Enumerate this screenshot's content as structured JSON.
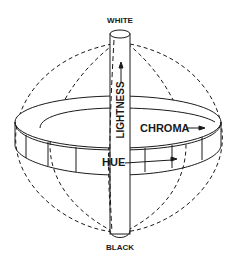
{
  "diagram": {
    "labels": {
      "top": "WHITE",
      "bottom": "BLACK",
      "axis": "LIGHTNESS",
      "radial": "CHROMA",
      "circumferential": "HUE"
    },
    "colors": {
      "line": "#1a1a1a",
      "background": "#ffffff"
    }
  }
}
